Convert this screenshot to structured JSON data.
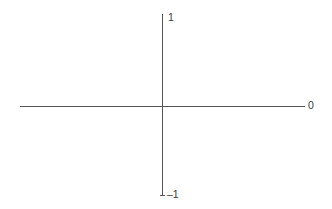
{
  "figure": {
    "background_color": "#ffffff",
    "line_color": "#565656",
    "label_color": "#3a3a3a"
  },
  "labels": {
    "y_max": "1",
    "y_min": "–1",
    "x_end": "0"
  },
  "chart_data": {
    "type": "line",
    "title": "",
    "subtitle": "",
    "xlabel": "",
    "ylabel": "",
    "grid": false,
    "legend": null,
    "axes": {
      "vertical": {
        "tick_labels": [
          "1",
          "–1"
        ],
        "ticks": [
          1,
          -1
        ],
        "range": [
          -1,
          1
        ],
        "label_positions": [
          "top",
          "bottom"
        ]
      },
      "horizontal": {
        "tick_labels": [
          "0"
        ],
        "ticks": [
          0
        ],
        "range": [
          null,
          null
        ],
        "label_positions": [
          "right-end"
        ]
      }
    },
    "series": [],
    "annotations": [
      {
        "text": "1",
        "position": "vertical-axis-top"
      },
      {
        "text": "–1",
        "position": "vertical-axis-bottom"
      },
      {
        "text": "0",
        "position": "horizontal-axis-right"
      }
    ]
  }
}
